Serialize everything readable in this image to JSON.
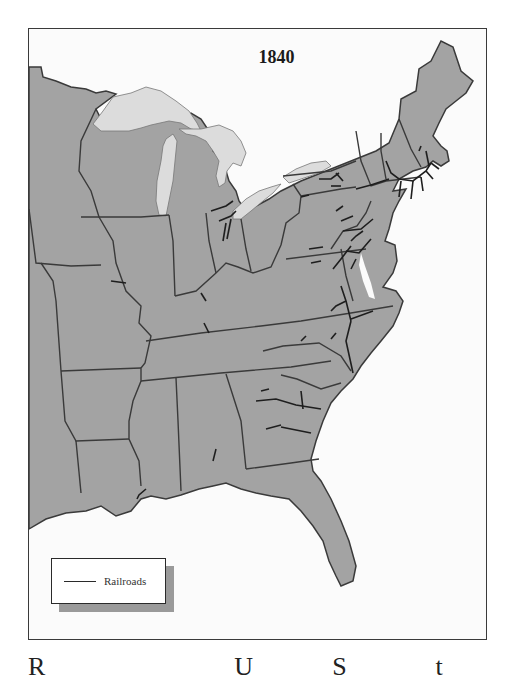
{
  "map": {
    "title": "1840",
    "region": "Eastern United States",
    "colors": {
      "land": "#a3a3a3",
      "lakes": "#dcdcdc",
      "water": "#fbfbfb",
      "borders": "#3a3a3a",
      "railroads": "#1e1e1e"
    }
  },
  "legend": {
    "items": [
      {
        "symbol": "line",
        "label": "Railroads"
      }
    ]
  },
  "caption": {
    "partial_letters": [
      "R",
      "U",
      "S",
      "t"
    ]
  }
}
